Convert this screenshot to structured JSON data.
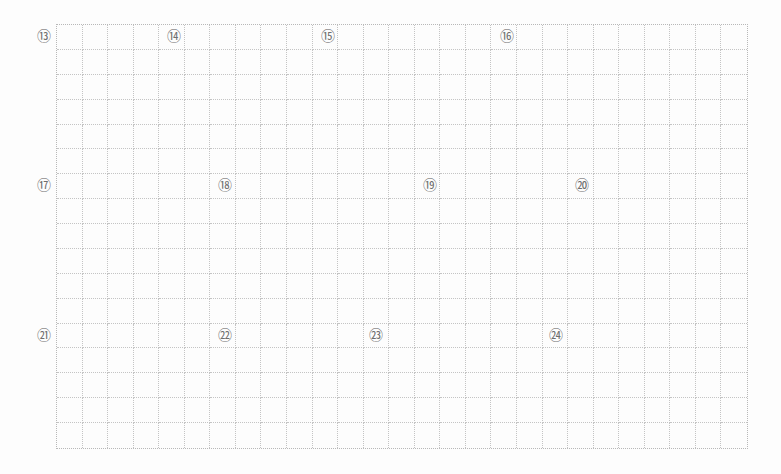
{
  "grid": {
    "rows": 17,
    "cols": 27,
    "cell_width": 25.63,
    "cell_height": 25,
    "line_color": "#c4c4c4",
    "border_color": "#b8b8b8",
    "line_style": "dotted"
  },
  "markers": [
    {
      "label": "⑬",
      "number": 13,
      "x": 44,
      "y": 36
    },
    {
      "label": "⑭",
      "number": 14,
      "x": 174,
      "y": 36
    },
    {
      "label": "⑮",
      "number": 15,
      "x": 328,
      "y": 36
    },
    {
      "label": "⑯",
      "number": 16,
      "x": 507,
      "y": 36
    },
    {
      "label": "⑰",
      "number": 17,
      "x": 44,
      "y": 185
    },
    {
      "label": "⑱",
      "number": 18,
      "x": 225,
      "y": 185
    },
    {
      "label": "⑲",
      "number": 19,
      "x": 430,
      "y": 185
    },
    {
      "label": "⑳",
      "number": 20,
      "x": 582,
      "y": 185
    },
    {
      "label": "㉑",
      "number": 21,
      "x": 44,
      "y": 335
    },
    {
      "label": "㉒",
      "number": 22,
      "x": 225,
      "y": 335
    },
    {
      "label": "㉓",
      "number": 23,
      "x": 376,
      "y": 335
    },
    {
      "label": "㉔",
      "number": 24,
      "x": 556,
      "y": 335
    }
  ],
  "colors": {
    "background": "#fdfdfd",
    "marker_text": "#6e6e6e"
  }
}
